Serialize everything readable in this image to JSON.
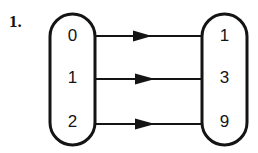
{
  "figure": {
    "problem_number": "1.",
    "type": "mapping-diagram",
    "domain_set": {
      "name": "domain-oval",
      "elements": [
        "0",
        "1",
        "2"
      ]
    },
    "range_set": {
      "name": "range-oval",
      "elements": [
        "1",
        "3",
        "9"
      ]
    },
    "mappings": [
      {
        "from": "0",
        "to": "1"
      },
      {
        "from": "1",
        "to": "3"
      },
      {
        "from": "2",
        "to": "9"
      }
    ],
    "colors": {
      "stroke": "#141414",
      "background": "#ffffff",
      "text": "#151515"
    }
  }
}
